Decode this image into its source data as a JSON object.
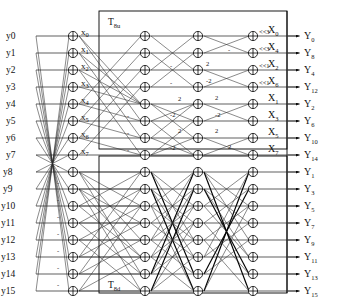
{
  "diagram": {
    "title_top_block": "T",
    "blocks": [
      {
        "name": "top-block",
        "label_base": "T",
        "label_sub": "8u"
      },
      {
        "name": "bottom-block",
        "label_base": "T",
        "label_sub": "8d"
      }
    ],
    "inputs": [
      "y0",
      "y1",
      "y2",
      "y3",
      "y4",
      "y5",
      "y6",
      "y7",
      "y8",
      "y9",
      "y10",
      "y11",
      "y12",
      "y13",
      "y14",
      "y15"
    ],
    "intermediate_labels": [
      {
        "base": "x",
        "sub": "0"
      },
      {
        "base": "x",
        "sub": "1"
      },
      {
        "base": "x",
        "sub": "2"
      },
      {
        "base": "x",
        "sub": "3"
      },
      {
        "base": "x",
        "sub": "4"
      },
      {
        "base": "x",
        "sub": "5"
      },
      {
        "base": "x",
        "sub": "6"
      },
      {
        "base": "x",
        "sub": "7"
      }
    ],
    "stage_outputs_top": [
      {
        "base": "X",
        "sub": "0"
      },
      {
        "base": "X",
        "sub": "4"
      },
      {
        "base": "X",
        "sub": "2"
      },
      {
        "base": "X",
        "sub": "6"
      },
      {
        "base": "X",
        "sub": "1"
      },
      {
        "base": "X",
        "sub": "3"
      },
      {
        "base": "X",
        "sub": "5"
      },
      {
        "base": "X",
        "sub": "7"
      }
    ],
    "outputs_top": [
      {
        "base": "Y",
        "sub": "0"
      },
      {
        "base": "Y",
        "sub": "8"
      },
      {
        "base": "Y",
        "sub": "4"
      },
      {
        "base": "Y",
        "sub": "12"
      },
      {
        "base": "Y",
        "sub": "2"
      },
      {
        "base": "Y",
        "sub": "6"
      },
      {
        "base": "Y",
        "sub": "10"
      },
      {
        "base": "Y",
        "sub": "14"
      }
    ],
    "outputs_bottom": [
      {
        "base": "Y",
        "sub": "1"
      },
      {
        "base": "Y",
        "sub": "3"
      },
      {
        "base": "Y",
        "sub": "5"
      },
      {
        "base": "Y",
        "sub": "7"
      },
      {
        "base": "Y",
        "sub": "9"
      },
      {
        "base": "Y",
        "sub": "11"
      },
      {
        "base": "Y",
        "sub": "13"
      },
      {
        "base": "Y",
        "sub": "15"
      }
    ],
    "shift_labels": [
      "<<3",
      "<<3",
      "<<1",
      "<<1"
    ],
    "edge_weights_top": [
      "-",
      "-",
      "-",
      "-",
      "-",
      "2",
      "-2",
      "2",
      "-2",
      "2",
      "-2",
      "2",
      "-2",
      "2",
      "2",
      "-"
    ],
    "minus_signs_count": 8,
    "node_symbol": "plus-in-circle",
    "colors": {
      "wire": "#1a1a1a",
      "frame": "#000000",
      "node_fill": "#ffffff",
      "background": "#ffffff",
      "text": "#111111"
    }
  }
}
